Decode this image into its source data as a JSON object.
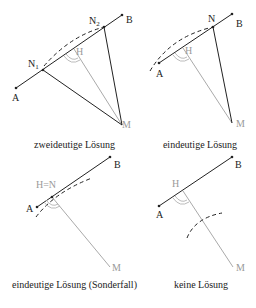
{
  "panels": [
    {
      "caption": "zweideutige Lösung",
      "labels": {
        "A": "A",
        "B": "B",
        "M": "M",
        "H": "H",
        "N1": "N",
        "N1_sub": "1",
        "N2": "N",
        "N2_sub": "2"
      }
    },
    {
      "caption": "eindeutige Lösung",
      "labels": {
        "A": "A",
        "B": "B",
        "M": "M",
        "H": "H",
        "N": "N"
      }
    },
    {
      "caption": "eindeutige Lösung (Sonderfall)",
      "labels": {
        "A": "A",
        "B": "B",
        "M": "M",
        "HN": "H=N"
      }
    },
    {
      "caption": "keine Lösung",
      "labels": {
        "A": "A",
        "B": "B",
        "M": "M",
        "H": "H"
      }
    }
  ],
  "colors": {
    "line": "#222222",
    "perp": "#a8a8a8",
    "label_gray": "#999999"
  }
}
